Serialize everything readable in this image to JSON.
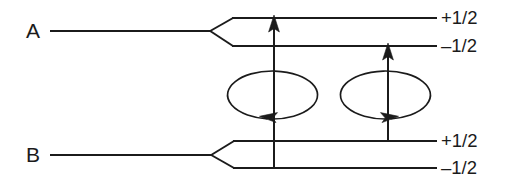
{
  "diagram": {
    "type": "energy-level-diagram",
    "background_color": "#ffffff",
    "line_color": "#1b1b1b",
    "states": [
      {
        "id": "A",
        "label": "A",
        "label_x": 33,
        "label_y": 38,
        "trunk": {
          "x1": 50,
          "y1": 31,
          "x2": 211,
          "y2": 31
        },
        "fork_vertex": {
          "x": 211,
          "y": 31
        },
        "sublevels": [
          {
            "name": "upper",
            "label": "+1/2",
            "line": {
              "x1": 233,
              "y": 18,
              "x2": 437
            },
            "fork_leg": {
              "x1": 211,
              "y1": 31,
              "x2": 233,
              "y2": 18
            },
            "label_x": 441,
            "label_y": 24
          },
          {
            "name": "lower",
            "label": "–1/2",
            "line": {
              "x1": 233,
              "y": 46,
              "x2": 437
            },
            "fork_leg": {
              "x1": 211,
              "y1": 31,
              "x2": 233,
              "y2": 46
            },
            "label_x": 441,
            "label_y": 52
          }
        ]
      },
      {
        "id": "B",
        "label": "B",
        "label_x": 33,
        "label_y": 162,
        "trunk": {
          "x1": 50,
          "y1": 155,
          "x2": 212,
          "y2": 155
        },
        "fork_vertex": {
          "x": 212,
          "y": 155
        },
        "sublevels": [
          {
            "name": "upper",
            "label": "+1/2",
            "line": {
              "x1": 234,
              "y": 141,
              "x2": 437
            },
            "fork_leg": {
              "x1": 212,
              "y1": 155,
              "x2": 234,
              "y2": 141
            },
            "label_x": 441,
            "label_y": 147
          },
          {
            "name": "lower",
            "label": "–1/2",
            "line": {
              "x1": 234,
              "y": 168,
              "x2": 437
            },
            "fork_leg": {
              "x1": 212,
              "y1": 155,
              "x2": 234,
              "y2": 168
            },
            "label_x": 441,
            "label_y": 174
          }
        ]
      }
    ],
    "transitions": [
      {
        "id": "transition-left",
        "direction": "up",
        "x": 274,
        "y_start": 168,
        "y_end": 18,
        "from_level": "B –1/2",
        "to_level": "A +1/2"
      },
      {
        "id": "transition-right",
        "direction": "up",
        "x": 388,
        "y_start": 141,
        "y_end": 46,
        "from_level": "B +1/2",
        "to_level": "A –1/2"
      }
    ],
    "spin_loops": [
      {
        "id": "spin-loop-left",
        "cx": 273,
        "cy": 95,
        "rx": 45,
        "ry": 24,
        "sense": "counterclockwise",
        "arrow_direction": "left",
        "arrow_x": 272,
        "arrow_y": 114
      },
      {
        "id": "spin-loop-right",
        "cx": 385,
        "cy": 95,
        "rx": 45,
        "ry": 24,
        "sense": "clockwise",
        "arrow_direction": "right",
        "arrow_x": 386,
        "arrow_y": 114
      }
    ]
  }
}
